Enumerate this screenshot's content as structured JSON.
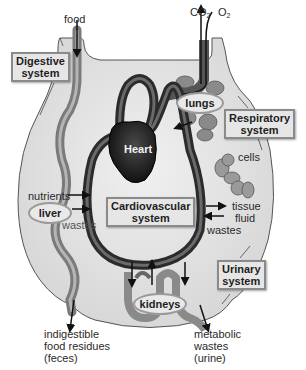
{
  "diagram": {
    "systems": {
      "digestive": "Digestive\nsystem",
      "digestive_l1": "Digestive",
      "digestive_l2": "system",
      "respiratory_l1": "Respiratory",
      "respiratory_l2": "system",
      "cardiovascular_l1": "Cardiovascular",
      "cardiovascular_l2": "system",
      "urinary_l1": "Urinary",
      "urinary_l2": "system"
    },
    "organs": {
      "heart": "Heart",
      "lungs": "lungs",
      "liver": "liver",
      "kidneys": "kidneys",
      "cells": "cells"
    },
    "labels": {
      "food": "food",
      "co2_main": "CO",
      "co2_sub": "2",
      "o2_main": "O",
      "o2_sub": "2",
      "nutrients": "nutrients",
      "wastes_left": "wastes",
      "tissue_fluid_l1": "tissue",
      "tissue_fluid_l2": "fluid",
      "wastes_right": "wastes",
      "feces_l1": "indigestible",
      "feces_l2": "food residues",
      "feces_l3": "(feces)",
      "urine_l1": "metabolic",
      "urine_l2": "wastes",
      "urine_l3": "(urine)"
    },
    "colors": {
      "body_fill": "#e4e4e4",
      "vessel_dark": "#2b2b2b",
      "vessel_mid": "#6a6a6a",
      "heart": "#1a1a1a",
      "organ_gray": "#8c8c8c",
      "box_bg": "#e6e6e6",
      "box_border": "#8a8a8a"
    }
  }
}
